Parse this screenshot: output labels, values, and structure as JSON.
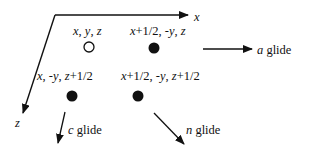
{
  "axes": {
    "x_label": "x",
    "z_label": "z"
  },
  "positions": [
    {
      "label_parts": [
        {
          "t": "x",
          "i": true
        },
        {
          "t": ", "
        },
        {
          "t": "y",
          "i": true
        },
        {
          "t": ", "
        },
        {
          "t": "z",
          "i": true
        }
      ],
      "marker": "open"
    },
    {
      "label_parts": [
        {
          "t": "x",
          "i": true
        },
        {
          "t": "+1/2, -"
        },
        {
          "t": "y",
          "i": true
        },
        {
          "t": ", "
        },
        {
          "t": "z",
          "i": true
        }
      ],
      "marker": "filled"
    },
    {
      "label_parts": [
        {
          "t": "x",
          "i": true
        },
        {
          "t": ", -"
        },
        {
          "t": "y",
          "i": true
        },
        {
          "t": ", "
        },
        {
          "t": "z",
          "i": true
        },
        {
          "t": "+1/2"
        }
      ],
      "marker": "filled"
    },
    {
      "label_parts": [
        {
          "t": "x",
          "i": true
        },
        {
          "t": "+1/2, -"
        },
        {
          "t": "y",
          "i": true
        },
        {
          "t": ", "
        },
        {
          "t": "z",
          "i": true
        },
        {
          "t": "+1/2"
        }
      ],
      "marker": "filled"
    }
  ],
  "glides": {
    "a": {
      "letter": "a",
      "word": " glide"
    },
    "c": {
      "letter": "c",
      "word": " glide"
    },
    "n": {
      "letter": "n",
      "word": " glide"
    }
  }
}
